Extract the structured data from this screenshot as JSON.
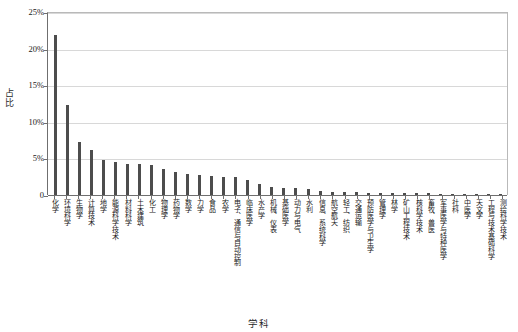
{
  "chart_data": {
    "type": "bar",
    "title": "",
    "xlabel": "学科",
    "ylabel": "占比",
    "ylim": [
      0,
      25
    ],
    "ytick_labels": [
      "25%",
      "20%",
      "15%",
      "10%",
      "5%",
      "0"
    ],
    "ytick_values": [
      25,
      20,
      15,
      10,
      5,
      0
    ],
    "grid": true,
    "legend": "none",
    "bar_color": "#4d4d4d",
    "categories": [
      "化学",
      "环境科学",
      "生物学",
      "计算技术",
      "地学",
      "能源科学技术",
      "材料科学",
      "土木建筑",
      "化工",
      "物理学",
      "药物学",
      "数学",
      "力学",
      "食品",
      "农学",
      "电子、通信与自动控制",
      "临床医学",
      "水产学",
      "机械、仪表",
      "基础医学",
      "动力与电气",
      "水利",
      "信息、系统科学",
      "航空航天",
      "轻工、纺织",
      "交通运输",
      "预防医学与卫生学",
      "管理学",
      "林学",
      "矿山工程技术",
      "核科学技术",
      "畜牧、兽医",
      "军事医学与特种医学",
      "社科",
      "中医学",
      "天文学",
      "工程与技术基础科学",
      "测绘科学技术"
    ],
    "values": [
      21.8,
      12.3,
      7.3,
      6.2,
      4.8,
      4.5,
      4.3,
      4.2,
      4.1,
      3.6,
      3.2,
      2.9,
      2.7,
      2.6,
      2.5,
      2.4,
      2.0,
      1.5,
      1.1,
      1.0,
      0.9,
      0.8,
      0.5,
      0.45,
      0.4,
      0.35,
      0.32,
      0.3,
      0.28,
      0.26,
      0.24,
      0.22,
      0.2,
      0.18,
      0.16,
      0.14,
      0.12,
      0.1
    ]
  }
}
